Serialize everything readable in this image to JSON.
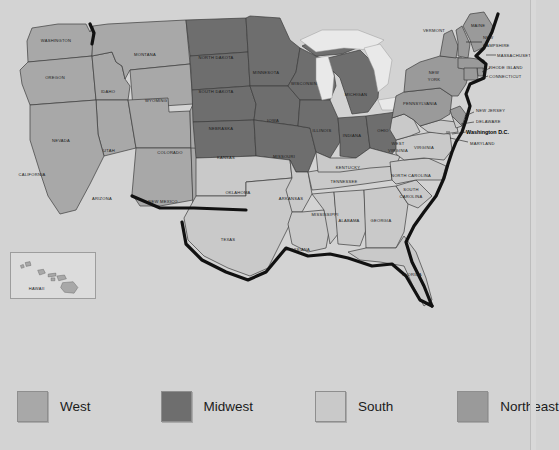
{
  "figure": {
    "type": "choropleth-region-map",
    "background_color": "#d3d3d3"
  },
  "legend": {
    "items": [
      {
        "label": "West",
        "color": "#a8a8a8",
        "swatch_name": "legend-swatch-west"
      },
      {
        "label": "Midwest",
        "color": "#6e6e6e",
        "swatch_name": "legend-swatch-midwest"
      },
      {
        "label": "South",
        "color": "#c9c9c9",
        "swatch_name": "legend-swatch-south"
      },
      {
        "label": "Northeast",
        "color": "#9a9a9a",
        "swatch_name": "legend-swatch-northeast"
      }
    ]
  },
  "inset": {
    "label": "HAWAII"
  },
  "capital": {
    "label": "Washington D.C."
  },
  "states": {
    "washington": "WASHINGTON",
    "oregon": "OREGON",
    "idaho": "IDAHO",
    "montana": "MONTANA",
    "wyoming": "WYOMING",
    "nevada": "NEVADA",
    "utah": "UTAH",
    "california": "CALIFORNIA",
    "colorado": "COLORADO",
    "arizona": "ARIZONA",
    "new_mexico": "NEW MEXICO",
    "north_dakota": "NORTH DAKOTA",
    "south_dakota": "SOUTH DAKOTA",
    "minnesota": "MINNESOTA",
    "wisconsin": "WISCONSIN",
    "michigan": "MICHIGAN",
    "iowa": "IOWA",
    "nebraska": "NEBRASKA",
    "kansas": "KANSAS",
    "missouri": "MISSOURI",
    "illinois": "ILLINOIS",
    "indiana": "INDIANA",
    "ohio": "OHIO",
    "oklahoma": "OKLAHOMA",
    "texas": "TEXAS",
    "arkansas": "ARKANSAS",
    "louisiana": "LOUISIANA",
    "mississippi": "MISSISSIPPI",
    "alabama": "ALABAMA",
    "tennessee": "TENNESSEE",
    "kentucky": "KENTUCKY",
    "georgia": "GEORGIA",
    "florida": "FLORIDA",
    "south_carolina_1": "SOUTH",
    "south_carolina_2": "CAROLINA",
    "north_carolina": "NORTH CAROLINA",
    "virginia": "VIRGINIA",
    "west_virginia_1": "WEST",
    "west_virginia_2": "VIRGINIA",
    "maryland": "MARYLAND",
    "delaware": "DELAWARE",
    "new_jersey": "NEW JERSEY",
    "pennsylvania": "PENNSYLVANIA",
    "new_york_1": "NEW",
    "new_york_2": "YORK",
    "connecticut": "CONNECTICUT",
    "rhode_island": "RHODE ISLAND",
    "massachusetts": "MASSACHUSETTS",
    "vermont": "VERMONT",
    "new_hampshire_1": "NEW",
    "new_hampshire_2": "HAMPSHIRE",
    "maine": "MAINE"
  },
  "region_membership": {
    "West": [
      "WASHINGTON",
      "OREGON",
      "IDAHO",
      "MONTANA",
      "WYOMING",
      "NEVADA",
      "UTAH",
      "CALIFORNIA",
      "COLORADO",
      "ARIZONA",
      "NEW MEXICO"
    ],
    "Midwest": [
      "NORTH DAKOTA",
      "SOUTH DAKOTA",
      "MINNESOTA",
      "WISCONSIN",
      "MICHIGAN",
      "IOWA",
      "NEBRASKA",
      "KANSAS",
      "MISSOURI",
      "ILLINOIS",
      "INDIANA",
      "OHIO"
    ],
    "South": [
      "OKLAHOMA",
      "TEXAS",
      "ARKANSAS",
      "LOUISIANA",
      "MISSISSIPPI",
      "ALABAMA",
      "TENNESSEE",
      "KENTUCKY",
      "GEORGIA",
      "FLORIDA",
      "SOUTH CAROLINA",
      "NORTH CAROLINA",
      "VIRGINIA",
      "WEST VIRGINIA",
      "MARYLAND",
      "DELAWARE",
      "Washington D.C."
    ],
    "Northeast": [
      "PENNSYLVANIA",
      "NEW JERSEY",
      "NEW YORK",
      "CONNECTICUT",
      "RHODE ISLAND",
      "MASSACHUSETTS",
      "VERMONT",
      "NEW HAMPSHIRE",
      "MAINE"
    ]
  }
}
